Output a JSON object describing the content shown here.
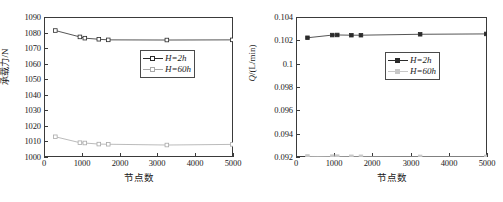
{
  "figure": {
    "width": 503,
    "height": 202,
    "background": "#ffffff",
    "caption": ""
  },
  "colors": {
    "axis": "#3a3a3a",
    "series_dark": "#2b2b2b",
    "series_light": "#a9a9a9",
    "legend_border": "#4a4a4a",
    "text": "#1a1a1a"
  },
  "chart_data": [
    {
      "id": "left",
      "type": "line",
      "title": "",
      "xlabel": "节点数",
      "ylabel": "承载力/N",
      "xlim": [
        0,
        5000
      ],
      "ylim": [
        1000,
        1090
      ],
      "xticks": [
        0,
        1000,
        2000,
        3000,
        4000,
        5000
      ],
      "xticklabels": [
        "0",
        "1000",
        "2000",
        "3000",
        "4000",
        "5000"
      ],
      "yticks": [
        1000,
        1010,
        1020,
        1030,
        1040,
        1050,
        1060,
        1070,
        1080,
        1090
      ],
      "yticklabels": [
        "1000",
        "1010",
        "1020",
        "1030",
        "1040",
        "1050",
        "1060",
        "1070",
        "1080",
        "1090"
      ],
      "grid": false,
      "marker": "open-square",
      "legend_position": "center-right",
      "x": [
        300,
        950,
        1080,
        1450,
        1700,
        3250,
        4980
      ],
      "series": [
        {
          "name": "H=2h",
          "label_prefix": "H",
          "label_suffix": "=2h",
          "color": "#2b2b2b",
          "values": [
            1081.3,
            1077.2,
            1076.4,
            1075.7,
            1075.3,
            1075.2,
            1075.3
          ]
        },
        {
          "name": "H=60h",
          "label_prefix": "H",
          "label_suffix": "=60h",
          "color": "#a9a9a9",
          "values": [
            1013.0,
            1009.2,
            1009.0,
            1008.3,
            1008.2,
            1007.7,
            1008.1
          ]
        }
      ]
    },
    {
      "id": "right",
      "type": "line",
      "title": "",
      "xlabel": "节点数",
      "ylabel": "Q/(L/min)",
      "xlim": [
        0,
        5000
      ],
      "ylim": [
        0.092,
        0.104
      ],
      "xticks": [
        0,
        1000,
        2000,
        3000,
        4000,
        5000
      ],
      "xticklabels": [
        "0",
        "1000",
        "2000",
        "3000",
        "4000",
        "5000"
      ],
      "yticks": [
        0.092,
        0.094,
        0.096,
        0.098,
        0.1,
        0.102,
        0.104
      ],
      "yticklabels": [
        "0.092",
        "0.094",
        "0.096",
        "0.098",
        "0.1",
        "0.102",
        "0.104"
      ],
      "grid": false,
      "marker": "filled-square",
      "legend_position": "center-right",
      "x": [
        300,
        950,
        1080,
        1450,
        1700,
        3250,
        4980
      ],
      "series": [
        {
          "name": "H=2h",
          "label_prefix": "H",
          "label_suffix": "=2h",
          "color": "#2b2b2b",
          "values": [
            0.10222,
            0.10245,
            0.10246,
            0.10244,
            0.10244,
            0.10252,
            0.10255
          ]
        },
        {
          "name": "H=60h",
          "label_prefix": "H",
          "label_suffix": "=60h",
          "color": "#c8c8c8",
          "values": [
            0.09205,
            0.09203,
            0.09203,
            0.09202,
            0.09202,
            0.09201,
            0.09201
          ]
        }
      ]
    }
  ]
}
